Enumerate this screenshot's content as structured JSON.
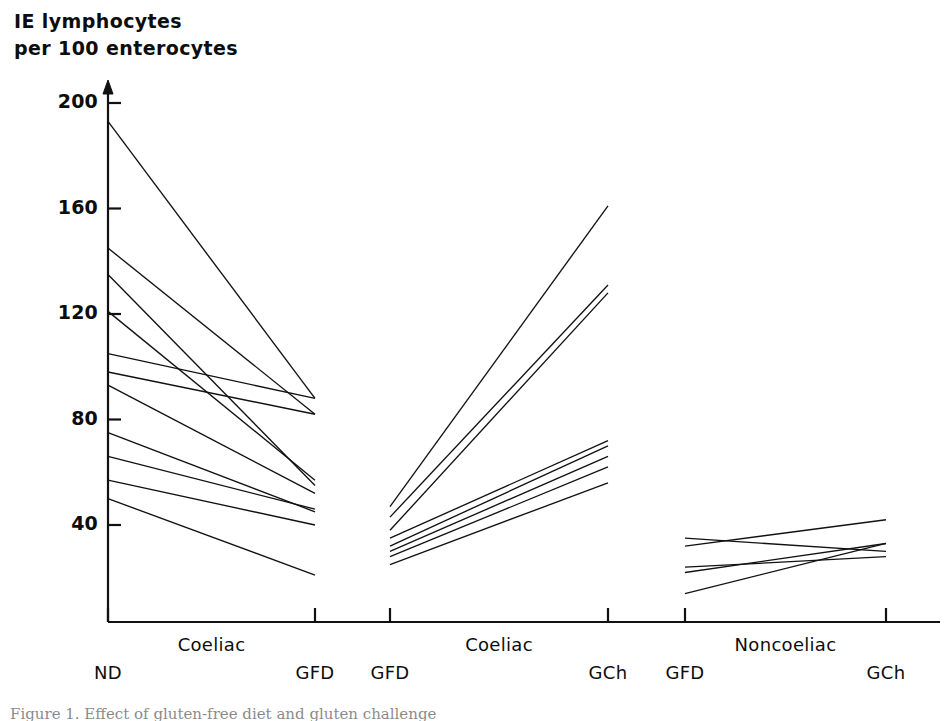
{
  "figure": {
    "axis_title": "IE lymphocytes\nper 100 enterocytes",
    "caption": "Figure 1. Effect of gluten-free diet and gluten challenge"
  },
  "axes": {
    "y_ticks": [
      "200",
      "160",
      "120",
      "80",
      "40"
    ],
    "y_tick_values": [
      200,
      160,
      120,
      80,
      40
    ],
    "x_ticks": [
      "ND",
      "GFD",
      "GFD",
      "GCh",
      "GFD",
      "GCh"
    ],
    "x_groups": [
      "Coeliac",
      "Coeliac",
      "Noncoeliac"
    ]
  },
  "chart_data": {
    "type": "line",
    "title": "",
    "subtitle": "",
    "xlabel": "",
    "ylabel": "IE lymphocytes per 100 enterocytes",
    "ylim": [
      0,
      210
    ],
    "grid": false,
    "legend": "none",
    "panels": [
      {
        "group": "Coeliac",
        "x_labels": [
          "ND",
          "GFD"
        ],
        "pairs": [
          [
            193,
            88
          ],
          [
            145,
            82
          ],
          [
            135,
            55
          ],
          [
            121,
            57
          ],
          [
            105,
            88
          ],
          [
            98,
            82
          ],
          [
            93,
            52
          ],
          [
            75,
            45
          ],
          [
            66,
            46
          ],
          [
            57,
            40
          ],
          [
            50,
            21
          ]
        ]
      },
      {
        "group": "Coeliac",
        "x_labels": [
          "GFD",
          "GCh"
        ],
        "pairs": [
          [
            47,
            161
          ],
          [
            43,
            131
          ],
          [
            38,
            128
          ],
          [
            35,
            72
          ],
          [
            32,
            70
          ],
          [
            30,
            66
          ],
          [
            28,
            62
          ],
          [
            25,
            56
          ]
        ]
      },
      {
        "group": "Noncoeliac",
        "x_labels": [
          "GFD",
          "GCh"
        ],
        "pairs": [
          [
            35,
            30
          ],
          [
            32,
            42
          ],
          [
            24,
            28
          ],
          [
            22,
            33
          ],
          [
            14,
            33
          ]
        ]
      }
    ]
  },
  "colors": {
    "ink": "#111111",
    "background": "#ffffff"
  }
}
